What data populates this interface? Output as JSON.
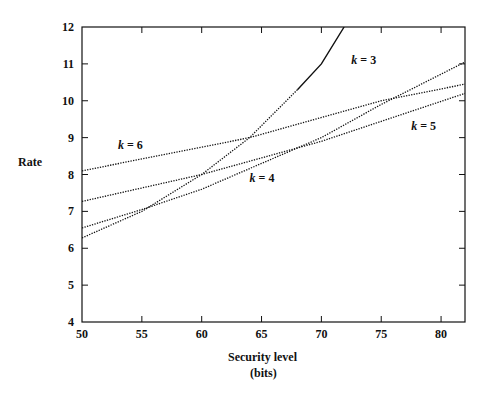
{
  "chart_data": {
    "type": "line",
    "title": "",
    "xlabel": "Security level",
    "xlabel_sub": "(bits)",
    "ylabel": "Rate",
    "xlim": [
      50,
      82
    ],
    "ylim": [
      4,
      12
    ],
    "x_ticks": [
      50,
      55,
      60,
      65,
      70,
      75,
      80
    ],
    "y_ticks": [
      4,
      5,
      6,
      7,
      8,
      9,
      10,
      11,
      12
    ],
    "grid": false,
    "legend": "inline labels",
    "series": [
      {
        "name": "k = 3",
        "x": [
          50,
          55,
          60,
          64,
          68,
          70,
          71.9
        ],
        "y": [
          6.28,
          7.0,
          8.0,
          9.0,
          10.3,
          11.0,
          12.0
        ],
        "style": "dotted below ~68, solid above"
      },
      {
        "name": "k = 4",
        "x": [
          50,
          55,
          60,
          65,
          70,
          75,
          82
        ],
        "y": [
          6.55,
          7.05,
          7.6,
          8.3,
          9.0,
          9.9,
          11.05
        ],
        "style": "dotted"
      },
      {
        "name": "k = 5",
        "x": [
          50,
          60,
          70,
          82
        ],
        "y": [
          7.27,
          8.0,
          8.9,
          10.2
        ],
        "style": "dotted"
      },
      {
        "name": "k = 6",
        "x": [
          50,
          64,
          75,
          82
        ],
        "y": [
          8.1,
          9.0,
          10.0,
          10.45
        ],
        "style": "dotted"
      }
    ],
    "annotations": [
      {
        "text": "k = 3",
        "x": 72.5,
        "y": 11.0
      },
      {
        "text": "k = 4",
        "x": 64,
        "y": 7.8
      },
      {
        "text": "k = 5",
        "x": 77.5,
        "y": 9.2
      },
      {
        "text": "k = 6",
        "x": 53,
        "y": 8.7
      }
    ]
  },
  "labels": {
    "ylabel": "Rate",
    "xlabel": "Security level",
    "xlabel_sub": "(bits)",
    "k3": "k = 3",
    "k4": "k = 4",
    "k5": "k = 5",
    "k6": "k = 6"
  }
}
